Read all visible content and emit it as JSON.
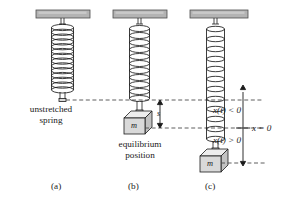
{
  "figure": {
    "background_color": "#ffffff",
    "ink_color": "#1a1a1a",
    "ceiling_fill": "#b3b3b3",
    "ceiling_stroke": "#4d4d4d",
    "mass_face_fill": "#d9d9d9",
    "mass_top_fill": "#ededed",
    "mass_side_fill": "#c2c2c2",
    "dash_color": "#4d4d4d"
  },
  "panels": [
    {
      "id": "a",
      "caption": "(a)",
      "description_line_1": "unstretched",
      "description_line_2": "spring",
      "spring_state": "unstretched",
      "has_mass": false
    },
    {
      "id": "b",
      "caption": "(b)",
      "description_line_1": "equilibrium",
      "description_line_2": "position",
      "spring_state": "stretched-equilibrium",
      "has_mass": true,
      "mass_label": "m",
      "stretch_label": "s"
    },
    {
      "id": "c",
      "caption": "(c)",
      "spring_state": "stretched-displaced",
      "has_mass": true,
      "mass_label": "m",
      "axis": {
        "above_label": "x(t) < 0",
        "origin_label": "x = 0",
        "below_label": "x(t) > 0"
      }
    }
  ],
  "annotations": {
    "unstretched_line_1": "unstretched",
    "unstretched_line_2": "spring",
    "equilibrium_line_1": "equilibrium",
    "equilibrium_line_2": "position",
    "stretch_amount": "s",
    "mass_symbol": "m",
    "x_negative": "x(t) < 0",
    "x_zero": "x = 0",
    "x_positive": "x(t) > 0",
    "caption_a": "(a)",
    "caption_b": "(b)",
    "caption_c": "(c)"
  }
}
